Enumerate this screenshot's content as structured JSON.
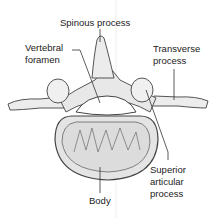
{
  "diagram": {
    "labels": {
      "spinous_process": "Spinous process",
      "vertebral_foramen_1": "Vertebral",
      "vertebral_foramen_2": "foramen",
      "transverse_process_1": "Transverse",
      "transverse_process_2": "process",
      "superior_articular_1": "Superior",
      "superior_articular_2": "articular",
      "superior_articular_3": "process",
      "body": "Body"
    }
  }
}
